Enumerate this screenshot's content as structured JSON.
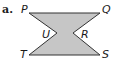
{
  "part_label": "a.",
  "fill_color": "#c6c6c6",
  "stroke_color": "#333333",
  "vertices": {
    "P": "P",
    "Q": "Q",
    "R": "R",
    "S": "S",
    "T": "T",
    "U": "U"
  }
}
